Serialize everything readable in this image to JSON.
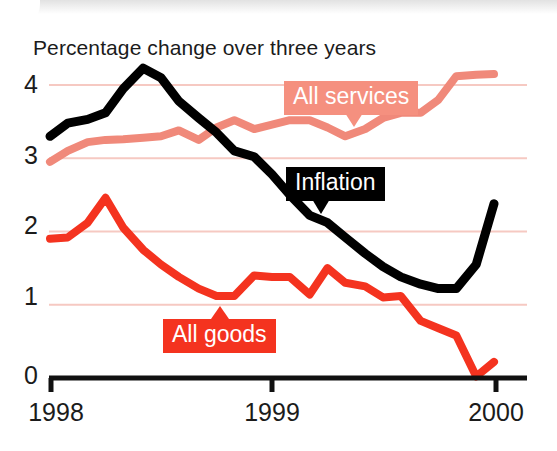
{
  "chart_data": {
    "type": "line",
    "title": "Percentage change over three years",
    "xlabel": "",
    "ylabel": "",
    "xlim": [
      1998.0,
      2000.0
    ],
    "ylim": [
      0,
      4.4
    ],
    "x_ticks": [
      "1998",
      "1999",
      "2000"
    ],
    "x_tick_values": [
      1998,
      1999,
      2000
    ],
    "y_ticks": [
      "0",
      "1",
      "2",
      "3",
      "4"
    ],
    "y_tick_values": [
      0,
      1,
      2,
      3,
      4
    ],
    "grid": "horizontal",
    "grid_color": "#f6c9c2",
    "legend": "inline-callouts",
    "series": [
      {
        "name": "Inflation",
        "color": "#000000",
        "x": [
          1998.0,
          1998.08,
          1998.17,
          1998.25,
          1998.33,
          1998.42,
          1998.5,
          1998.58,
          1998.67,
          1998.75,
          1998.83,
          1998.92,
          1999.0,
          1999.08,
          1999.17,
          1999.25,
          1999.33,
          1999.42,
          1999.5,
          1999.58,
          1999.67,
          1999.75,
          1999.83,
          1999.92,
          2000.0
        ],
        "values": [
          3.3,
          3.48,
          3.53,
          3.62,
          3.95,
          4.23,
          4.1,
          3.78,
          3.55,
          3.35,
          3.1,
          3.02,
          2.78,
          2.5,
          2.22,
          2.12,
          1.92,
          1.7,
          1.52,
          1.38,
          1.28,
          1.22,
          1.22,
          1.55,
          2.38
        ]
      },
      {
        "name": "All services",
        "color": "#f0897a",
        "x": [
          1998.0,
          1998.08,
          1998.17,
          1998.25,
          1998.33,
          1998.42,
          1998.5,
          1998.58,
          1998.67,
          1998.75,
          1998.83,
          1998.92,
          1999.0,
          1999.08,
          1999.17,
          1999.25,
          1999.33,
          1999.42,
          1999.5,
          1999.58,
          1999.67,
          1999.75,
          1999.83,
          1999.92,
          2000.0
        ],
        "values": [
          2.95,
          3.1,
          3.22,
          3.25,
          3.26,
          3.28,
          3.3,
          3.38,
          3.25,
          3.42,
          3.52,
          3.4,
          3.46,
          3.52,
          3.52,
          3.42,
          3.3,
          3.4,
          3.55,
          3.62,
          3.62,
          3.8,
          4.12,
          4.14,
          4.15
        ]
      },
      {
        "name": "All goods",
        "color": "#f4331f",
        "x": [
          1998.0,
          1998.08,
          1998.17,
          1998.25,
          1998.33,
          1998.42,
          1998.5,
          1998.58,
          1998.67,
          1998.75,
          1998.83,
          1998.92,
          1999.0,
          1999.08,
          1999.17,
          1999.25,
          1999.33,
          1999.42,
          1999.5,
          1999.58,
          1999.67,
          1999.75,
          1999.83,
          1999.92,
          2000.0
        ],
        "values": [
          1.9,
          1.92,
          2.12,
          2.46,
          2.05,
          1.75,
          1.55,
          1.38,
          1.22,
          1.12,
          1.12,
          1.4,
          1.38,
          1.38,
          1.14,
          1.5,
          1.3,
          1.25,
          1.1,
          1.12,
          0.78,
          0.68,
          0.58,
          0.02,
          0.22
        ]
      }
    ],
    "annotations": [
      {
        "text": "All services",
        "series": "All services",
        "style": "callout",
        "background": "#f5907f",
        "text_color": "#ffffff",
        "pointer": "down"
      },
      {
        "text": "Inflation",
        "series": "Inflation",
        "style": "callout",
        "background": "#000000",
        "text_color": "#ffffff",
        "pointer": "down"
      },
      {
        "text": "All goods",
        "series": "All goods",
        "style": "callout",
        "background": "#f4331f",
        "text_color": "#ffffff",
        "pointer": "up"
      }
    ]
  },
  "labels": {
    "title": "Percentage change over three years",
    "y4": "4",
    "y3": "3",
    "y2": "2",
    "y1": "1",
    "y0": "0",
    "x1998": "1998",
    "x1999": "1999",
    "x2000": "2000",
    "callout_services": "All services",
    "callout_inflation": "Inflation",
    "callout_goods": "All goods"
  }
}
